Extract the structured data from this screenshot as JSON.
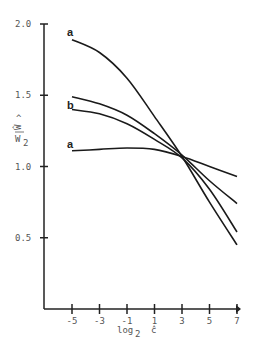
{
  "chart_data": {
    "type": "line",
    "title": "",
    "xlabel": "log2 ĉ",
    "ylabel": "Ŵ / W2",
    "xlim": [
      -8,
      7
    ],
    "ylim": [
      0,
      2.0
    ],
    "x_ticks": [
      -5,
      -3,
      -1,
      1,
      3,
      5,
      7
    ],
    "y_ticks": [
      0.5,
      1.0,
      1.5,
      2.0
    ],
    "y_tick_labels": [
      "0.5",
      "1.0",
      "1.5",
      "2.0"
    ],
    "x_tick_labels": [
      "-5",
      "-3",
      "-1",
      "1",
      "3",
      "5",
      "7"
    ],
    "grid": false,
    "series": [
      {
        "name": "a",
        "label_position": "upper",
        "x": [
          -5,
          -3,
          -1,
          1,
          3,
          5,
          7
        ],
        "y": [
          1.89,
          1.8,
          1.62,
          1.35,
          1.07,
          0.75,
          0.45
        ]
      },
      {
        "name": "b",
        "label_position": "upper-middle",
        "x": [
          -5,
          -3,
          -1,
          1,
          3,
          5,
          7
        ],
        "y": [
          1.49,
          1.44,
          1.36,
          1.23,
          1.08,
          0.9,
          0.74
        ]
      },
      {
        "name": "b",
        "label_position": "lower-middle",
        "x": [
          -5,
          -3,
          -1,
          1,
          3,
          5,
          7
        ],
        "y": [
          1.4,
          1.37,
          1.3,
          1.19,
          1.06,
          0.84,
          0.54
        ]
      },
      {
        "name": "a",
        "label_position": "lower",
        "x": [
          -5,
          -3,
          -1,
          1,
          3,
          5,
          7
        ],
        "y": [
          1.11,
          1.12,
          1.13,
          1.12,
          1.07,
          1.0,
          0.93
        ]
      }
    ]
  },
  "labels": {
    "curve_a_top": "a",
    "curve_b": "b",
    "curve_a_bottom": "a",
    "ylabel_top": "Ŵ",
    "ylabel_bottom": "W",
    "ylabel_sub": "2",
    "xlabel_main": "log",
    "xlabel_sub": "2",
    "xlabel_var": "ĉ"
  }
}
